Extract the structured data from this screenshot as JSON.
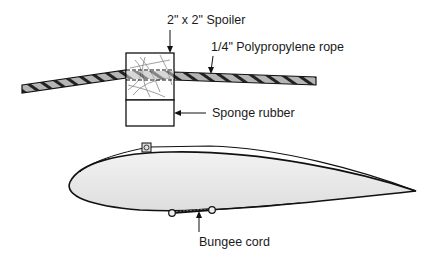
{
  "diagram": {
    "labels": {
      "spoiler": "2\" x 2\" Spoiler",
      "rope": "1/4\" Polypropylene rope",
      "sponge": "Sponge rubber",
      "bungee": "Bungee cord"
    },
    "colors": {
      "line": "#111111",
      "rope_fill": "#b5b5b5",
      "airfoil_fill": "#e6e6e6",
      "background": "#ffffff"
    }
  }
}
